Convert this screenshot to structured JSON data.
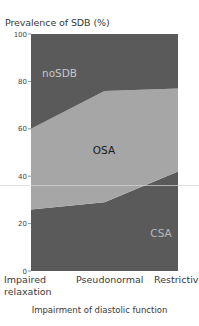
{
  "chart_data": {
    "type": "area",
    "stacked": true,
    "title": "",
    "ylabel": "Prevalence of SDB (%)",
    "xlabel": "Impairment of diastolic function",
    "categories": [
      "Impaired relaxation",
      "Pseudonormal",
      "Restrictive"
    ],
    "category_lines": [
      [
        "Impaired",
        "relaxation"
      ],
      [
        "Pseudonormal"
      ],
      [
        "Restrictive"
      ]
    ],
    "ylim": [
      0,
      100
    ],
    "yticks": [
      0,
      20,
      40,
      60,
      80,
      100
    ],
    "grid": false,
    "legend": "inline labels",
    "series": [
      {
        "name": "CSA",
        "values": [
          26,
          29,
          42
        ],
        "color": "#5a5a5a",
        "label_color": "#b8b8b8"
      },
      {
        "name": "OSA",
        "values": [
          34,
          47,
          35
        ],
        "color": "#a6a6a6",
        "label_color": "#1a1a1a"
      },
      {
        "name": "noSDB",
        "values": [
          40,
          24,
          23
        ],
        "color": "#5a5a5a",
        "label_color": "#c8c8c8"
      }
    ]
  }
}
